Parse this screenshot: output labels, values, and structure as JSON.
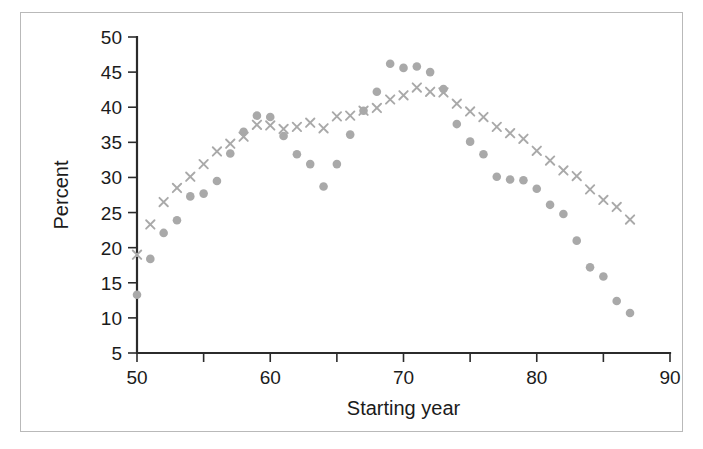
{
  "figure": {
    "kind": "scatter-plot-figure",
    "background_color": "#ffffff",
    "frame_color": "#b9b9b9",
    "axis_color": "#2b2b2b",
    "marker_color": "#a9a9a9"
  },
  "chart_data": {
    "type": "scatter",
    "title": "",
    "subtitle": "",
    "xlabel": "Starting year",
    "ylabel": "Percent",
    "xlim": [
      50,
      90
    ],
    "ylim": [
      5,
      50
    ],
    "xticks": [
      50,
      60,
      70,
      80,
      90
    ],
    "xtick_labels": [
      "50",
      "60",
      "70",
      "80",
      "90"
    ],
    "xticks_minor": [
      55,
      65,
      75,
      85
    ],
    "yticks": [
      5,
      10,
      15,
      20,
      25,
      30,
      35,
      40,
      45,
      50
    ],
    "ytick_labels": [
      "5",
      "10",
      "15",
      "20",
      "25",
      "30",
      "35",
      "40",
      "45",
      "50"
    ],
    "grid": false,
    "legend": false,
    "legend_position": "none",
    "annotations": [],
    "series": [
      {
        "name": "series-dot",
        "marker": "circle",
        "color": "#a9a9a9",
        "x": [
          50,
          51,
          52,
          53,
          54,
          55,
          56,
          57,
          58,
          59,
          60,
          61,
          62,
          63,
          64,
          65,
          66,
          67,
          68,
          69,
          70,
          71,
          72,
          73,
          74,
          75,
          76,
          77,
          78,
          79,
          80,
          81,
          82,
          83,
          84,
          85,
          86,
          87
        ],
        "y": [
          13.3,
          18.4,
          22.1,
          23.9,
          27.3,
          27.7,
          29.5,
          33.4,
          36.5,
          38.8,
          38.6,
          35.9,
          33.3,
          31.9,
          28.7,
          31.9,
          36.1,
          39.5,
          42.2,
          46.2,
          45.6,
          45.8,
          45.0,
          42.6,
          37.6,
          35.1,
          33.3,
          30.1,
          29.7,
          29.6,
          28.4,
          26.1,
          24.8,
          21.0,
          17.2,
          15.9,
          12.4,
          10.7
        ]
      },
      {
        "name": "series-cross",
        "marker": "x",
        "color": "#a9a9a9",
        "x": [
          50,
          51,
          52,
          53,
          54,
          55,
          56,
          57,
          58,
          59,
          60,
          61,
          62,
          63,
          64,
          65,
          66,
          67,
          68,
          69,
          70,
          71,
          72,
          73,
          74,
          75,
          76,
          77,
          78,
          79,
          80,
          81,
          82,
          83,
          84,
          85,
          86,
          87
        ],
        "y": [
          19.0,
          23.3,
          26.5,
          28.5,
          30.1,
          31.9,
          33.7,
          34.8,
          35.8,
          37.5,
          37.4,
          36.9,
          37.2,
          37.8,
          37.0,
          38.7,
          38.8,
          39.5,
          39.9,
          41.1,
          41.7,
          42.8,
          42.2,
          42.1,
          40.5,
          39.4,
          38.6,
          37.2,
          36.3,
          35.5,
          33.8,
          32.4,
          31.0,
          30.2,
          28.3,
          26.8,
          25.8,
          24.0
        ]
      }
    ]
  }
}
